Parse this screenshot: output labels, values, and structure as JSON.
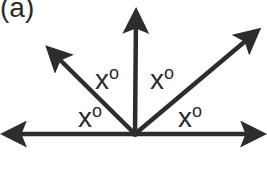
{
  "figure": {
    "panel_label": "(a)",
    "vertex": {
      "x": 135,
      "y": 134
    },
    "line_color": "#2d2d2d",
    "rays": [
      {
        "name": "left-horizontal",
        "to": {
          "x": 2,
          "y": 134
        }
      },
      {
        "name": "upper-left",
        "to": {
          "x": 46,
          "y": 46
        }
      },
      {
        "name": "vertical",
        "to": {
          "x": 136,
          "y": 9
        }
      },
      {
        "name": "upper-right",
        "to": {
          "x": 260,
          "y": 29
        }
      },
      {
        "name": "right-horizontal",
        "to": {
          "x": 265,
          "y": 134
        }
      }
    ],
    "angles": [
      {
        "id": "lower-left",
        "variable": "x",
        "unit": "o"
      },
      {
        "id": "upper-left",
        "variable": "x",
        "unit": "o"
      },
      {
        "id": "upper-right",
        "variable": "x",
        "unit": "o"
      },
      {
        "id": "lower-right",
        "variable": "x",
        "unit": "o"
      }
    ]
  }
}
